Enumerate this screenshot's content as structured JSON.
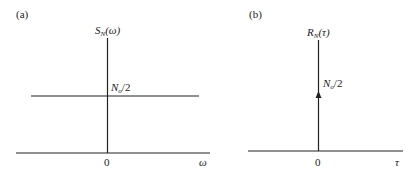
{
  "panels": [
    {
      "id": "a",
      "panel_label": "(a)",
      "y_axis_label": {
        "symbol": "S",
        "subscript": "N",
        "argument": "(ω)"
      },
      "level_label": {
        "symbol": "N",
        "subscript": "o",
        "rest": "/2"
      },
      "origin_label": "0",
      "x_axis_label": "ω",
      "description": "Flat power spectral density at level No/2 for all ω"
    },
    {
      "id": "b",
      "panel_label": "(b)",
      "y_axis_label": {
        "symbol": "R",
        "subscript": "N",
        "argument": "(τ)"
      },
      "level_label": {
        "symbol": "N",
        "subscript": "o",
        "rest": "/2"
      },
      "origin_label": "0",
      "x_axis_label": "τ",
      "description": "Autocorrelation: impulse of weight No/2 at τ = 0"
    }
  ],
  "colors": {
    "line": "#222222",
    "background": "#ffffff"
  }
}
